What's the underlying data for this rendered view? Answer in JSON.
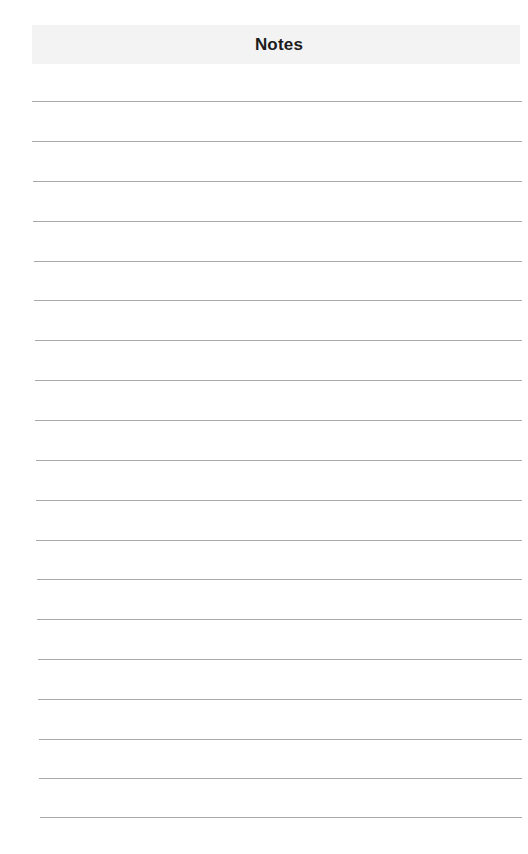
{
  "page": {
    "title": "Notes",
    "background_color": "#ffffff",
    "header_band_color": "#f3f3f3",
    "title_color": "#1c1c1c",
    "line_color": "#9a9a9a"
  },
  "ruled_lines": {
    "count": 19,
    "y_positions": [
      101,
      141,
      181,
      221,
      261,
      300,
      340,
      380,
      420,
      460,
      500,
      540,
      579,
      619,
      659,
      699,
      739,
      778,
      817
    ],
    "x_start": [
      32,
      32,
      33,
      33,
      34,
      34,
      35,
      35,
      35,
      36,
      36,
      36,
      37,
      37,
      38,
      38,
      39,
      39,
      40
    ],
    "x_end": 522
  }
}
